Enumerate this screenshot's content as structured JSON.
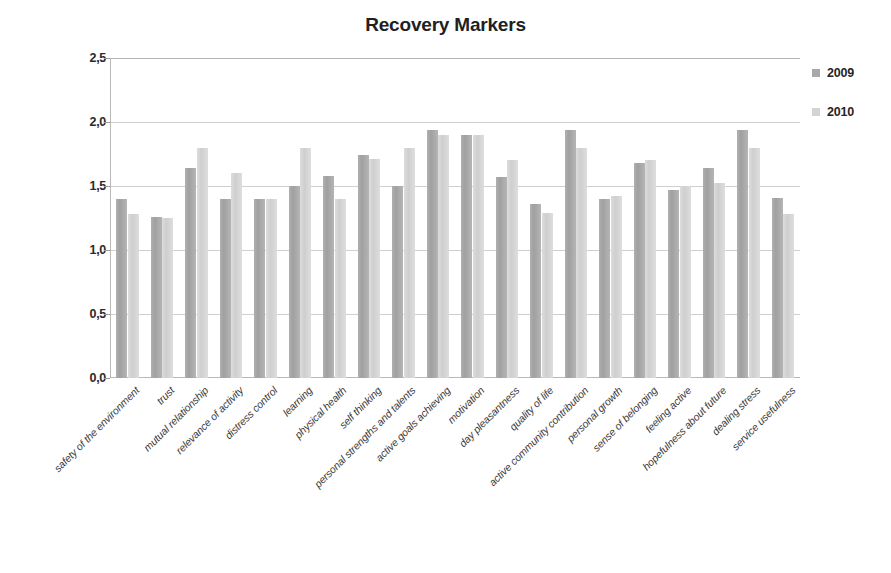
{
  "chart_data": {
    "type": "bar",
    "title": "Recovery Markers",
    "xlabel": "",
    "ylabel": "",
    "ylim": [
      0.0,
      2.5
    ],
    "ytick_labels": [
      "0,0",
      "0,5",
      "1,0",
      "1,5",
      "2,0",
      "2,5"
    ],
    "ytick_values": [
      0.0,
      0.5,
      1.0,
      1.5,
      2.0,
      2.5
    ],
    "grid": true,
    "legend_position": "right",
    "decimal_separator": ",",
    "categories": [
      "safety of the environment",
      "trust",
      "mutual relationship",
      "relevance of activity",
      "distress control",
      "learning",
      "physical health",
      "self thinking",
      "personal strengths and talents",
      "active goals achieving",
      "motivation",
      "day pleasantness",
      "quality of life",
      "active community contribution",
      "personal growth",
      "sense of belonging",
      "feeling active",
      "hopefulness about future",
      "dealing stress",
      "service usefulness"
    ],
    "series": [
      {
        "name": "2009",
        "color": "#a8a8a8",
        "values": [
          1.4,
          1.26,
          1.64,
          1.4,
          1.4,
          1.5,
          1.58,
          1.74,
          1.5,
          1.94,
          1.9,
          1.57,
          1.36,
          1.94,
          1.4,
          1.68,
          1.47,
          1.64,
          1.94,
          1.41
        ]
      },
      {
        "name": "2010",
        "color": "#d4d4d4",
        "values": [
          1.28,
          1.25,
          1.8,
          1.6,
          1.4,
          1.8,
          1.4,
          1.71,
          1.8,
          1.9,
          1.9,
          1.7,
          1.29,
          1.8,
          1.42,
          1.7,
          1.5,
          1.52,
          1.8,
          1.28
        ]
      }
    ]
  },
  "legend": {
    "items": [
      {
        "label": "2009",
        "color": "#a8a8a8"
      },
      {
        "label": "2010",
        "color": "#d4d4d4"
      }
    ]
  }
}
